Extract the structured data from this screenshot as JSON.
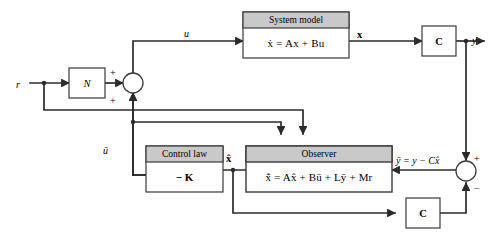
{
  "diagram": {
    "colors": {
      "header_gray": "#c9c9c9",
      "line": "#2b2b2b",
      "block_border": "#3a3a3a",
      "background": "#ffffff"
    },
    "blocks": {
      "system_model": {
        "header": "System model",
        "equation_prefix": "ẋ",
        "equation": "= Ax + Bu",
        "equation_full": "ẋ = Ax + Bu"
      },
      "observer": {
        "header": "Observer",
        "equation_prefix": "x̂̇",
        "equation": "= Ax̂ + Bū + Lȳ + Mr",
        "equation_full": "x̂̇ = Ax̂ + Bū + Lȳ + Mr"
      },
      "control_law": {
        "header": "Control law",
        "gain": "− K"
      },
      "prefilter": {
        "label": "N"
      },
      "output_matrix_top": {
        "label": "C"
      },
      "output_matrix_bottom": {
        "label": "C"
      }
    },
    "signals": {
      "reference": "r",
      "control_input": "u",
      "observer_input": "ū",
      "state": "x",
      "state_estimate": "x̂",
      "output": "y",
      "innovation": "ȳ = y − Cx̂"
    },
    "summing_junctions": {
      "left": {
        "name": "left-summing-junction",
        "signs": [
          "+",
          "+"
        ]
      },
      "right": {
        "name": "right-summing-junction",
        "signs": [
          "+",
          "−"
        ]
      }
    }
  }
}
